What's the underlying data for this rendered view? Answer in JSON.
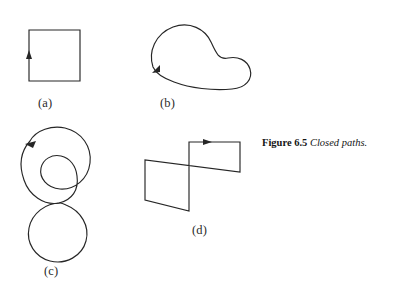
{
  "figure": {
    "caption_number": "Figure 6.5",
    "caption_text": "Closed paths.",
    "background_color": "#ffffff",
    "ink_color": "#262626"
  },
  "panels": [
    {
      "id": "a",
      "label": "(a)",
      "shape": "square",
      "description": "Square closed path with upward arrow on left edge",
      "direction": "counterclockwise",
      "arrow_direction": "up"
    },
    {
      "id": "b",
      "label": "(b)",
      "shape": "kidney-bean-curve",
      "description": "Smooth convex-concave closed loop with arrow on lower-left",
      "direction": "clockwise",
      "arrow_direction": "down-left"
    },
    {
      "id": "c",
      "label": "(c)",
      "shape": "double-loop-spiral",
      "description": "Self-intersecting spiral: large outer loop, small inner loop, lower loop",
      "direction": "counterclockwise",
      "arrow_direction": "left"
    },
    {
      "id": "d",
      "label": "(d)",
      "shape": "self-intersecting-polygon",
      "description": "Polygonal closed path crossing itself, arrow on top edge",
      "direction": "clockwise",
      "arrow_direction": "right"
    }
  ]
}
